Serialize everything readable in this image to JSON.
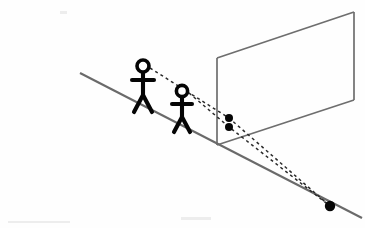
{
  "image": {
    "title": "Perspective projection of two observers onto a picture plane",
    "background_color": "#fefefe",
    "width": 365,
    "height": 228
  },
  "palette": {
    "ink": "#050505",
    "line_gray": "#6a6a6a",
    "edge_gray": "#6e6e6e",
    "dash_ink": "#2b2b2b",
    "paper": "#fefefe"
  },
  "ground": {
    "label": "ground-slope-line",
    "start_x": 80,
    "start_y": 73,
    "end_x": 362,
    "end_y": 218
  },
  "picture_plane": {
    "label": "picture-plane",
    "corners": [
      {
        "name": "bottom-left",
        "x": 217,
        "y": 145
      },
      {
        "name": "top-left",
        "x": 217,
        "y": 58
      },
      {
        "name": "top-right",
        "x": 354,
        "y": 12
      },
      {
        "name": "bottom-right",
        "x": 354,
        "y": 100
      }
    ]
  },
  "figures": [
    {
      "name": "observer-rear",
      "head_x": 143,
      "head_y": 66,
      "head_r": 6.0,
      "body_top_y": 72,
      "body_bottom_y": 95,
      "arm_y": 80,
      "arm_half_width": 11,
      "leg_spread": 9,
      "foot_y": 112
    },
    {
      "name": "observer-front",
      "head_x": 182,
      "head_y": 91,
      "head_r": 5.6,
      "body_top_y": 97,
      "body_bottom_y": 117,
      "arm_y": 104,
      "arm_half_width": 10,
      "leg_spread": 8,
      "foot_y": 132
    }
  ],
  "plane_points": [
    {
      "name": "projected-point-upper",
      "x": 229,
      "y": 118,
      "r": 4.0
    },
    {
      "name": "projected-point-lower",
      "x": 229,
      "y": 127,
      "r": 4.0
    }
  ],
  "ground_point": {
    "name": "convergence-point",
    "x": 330,
    "y": 206,
    "r": 5.2
  },
  "sight_lines": [
    {
      "name": "sight-line-rear-observer",
      "from_x": 150,
      "from_y": 68,
      "via_x": 229,
      "via_y": 118,
      "to_x": 330,
      "to_y": 206
    },
    {
      "name": "sight-line-front-observer",
      "from_x": 189,
      "from_y": 93,
      "via_x": 229,
      "via_y": 127,
      "to_x": 330,
      "to_y": 206
    }
  ],
  "specks": [
    {
      "x": 60,
      "y": 12,
      "w": 6,
      "h": 3
    },
    {
      "x": 181,
      "y": 218,
      "w": 30,
      "h": 3
    },
    {
      "x": 8,
      "y": 222,
      "w": 60,
      "h": 2
    }
  ]
}
